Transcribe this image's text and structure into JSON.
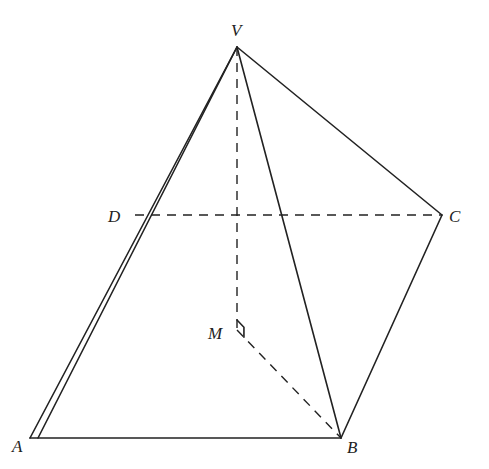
{
  "diagram": {
    "points": {
      "V": {
        "label": "V",
        "x": 237,
        "y": 47,
        "label_x": 231,
        "label_y": 36
      },
      "A": {
        "label": "A",
        "x": 30,
        "y": 438,
        "label_x": 12,
        "label_y": 452
      },
      "B": {
        "label": "B",
        "x": 341,
        "y": 438,
        "label_x": 347,
        "label_y": 453
      },
      "C": {
        "label": "C",
        "x": 442,
        "y": 215,
        "label_x": 449,
        "label_y": 222
      },
      "D": {
        "label": "D",
        "x": 135,
        "y": 215,
        "label_x": 108,
        "label_y": 222
      },
      "M": {
        "label": "M",
        "x": 237,
        "y": 330,
        "label_x": 208,
        "label_y": 339
      }
    },
    "solid_edges": [
      [
        "V",
        "A"
      ],
      [
        "V",
        "B"
      ],
      [
        "V",
        "C"
      ],
      [
        "A",
        "B"
      ],
      [
        "B",
        "C"
      ]
    ],
    "extra_solid_edges": [
      {
        "from": [
          237,
          47
        ],
        "to": [
          38,
          438
        ],
        "note": "second nearly parallel edge from V toward A"
      }
    ],
    "dashed_edges": [
      [
        "D",
        "C"
      ],
      [
        "V",
        "M"
      ],
      [
        "M",
        "B"
      ]
    ],
    "right_angle_marker": {
      "at": "M",
      "size": 10
    },
    "colors": {
      "stroke": "#222222",
      "background": "#ffffff"
    }
  }
}
